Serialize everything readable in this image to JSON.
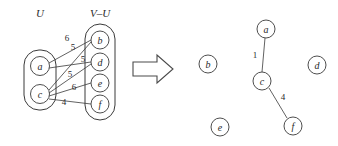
{
  "figure": {
    "colors": {
      "ink": "#3a3a3a",
      "text": "#2a2a2a",
      "background": "#ffffff"
    },
    "left_panel": {
      "set_label_u": "U",
      "set_label_v_minus_u": "V–U",
      "u_nodes": [
        {
          "id": "a",
          "label": "a",
          "cx": 40,
          "cy": 66,
          "r": 9.5
        },
        {
          "id": "c",
          "label": "c",
          "cx": 40,
          "cy": 94,
          "r": 9.5
        }
      ],
      "v_nodes": [
        {
          "id": "b",
          "label": "b",
          "cx": 100,
          "cy": 40,
          "r": 9
        },
        {
          "id": "d",
          "label": "d",
          "cx": 100,
          "cy": 62,
          "r": 9
        },
        {
          "id": "e",
          "label": "e",
          "cx": 100,
          "cy": 83,
          "r": 9
        },
        {
          "id": "f",
          "label": "f",
          "cx": 100,
          "cy": 104,
          "r": 9
        }
      ],
      "edges": [
        {
          "from": "a",
          "to": "b",
          "weight": "6",
          "lx": 67,
          "ly": 41
        },
        {
          "from": "a",
          "to": "d",
          "weight": "5",
          "lx": 73,
          "ly": 50
        },
        {
          "from": "c",
          "to": "b",
          "weight": "5",
          "lx": 83,
          "ly": 62
        },
        {
          "from": "c",
          "to": "d",
          "weight": "5",
          "lx": 70,
          "ly": 77
        },
        {
          "from": "c",
          "to": "e",
          "weight": "6",
          "lx": 74,
          "ly": 90
        },
        {
          "from": "c",
          "to": "f",
          "weight": "4",
          "lx": 64,
          "ly": 105
        }
      ]
    },
    "arrow": {
      "name": "right-arrow",
      "points": "133,62 157,62 157,55 173,69 157,83 157,76 133,76"
    },
    "right_panel": {
      "nodes": [
        {
          "id": "a",
          "label": "a",
          "cx": 266,
          "cy": 29,
          "r": 9
        },
        {
          "id": "b",
          "label": "b",
          "cx": 208,
          "cy": 64,
          "r": 9
        },
        {
          "id": "c",
          "label": "c",
          "cx": 262,
          "cy": 81,
          "r": 9
        },
        {
          "id": "d",
          "label": "d",
          "cx": 317,
          "cy": 65,
          "r": 9
        },
        {
          "id": "e",
          "label": "e",
          "cx": 220,
          "cy": 127,
          "r": 9
        },
        {
          "id": "f",
          "label": "f",
          "cx": 293,
          "cy": 126,
          "r": 9
        }
      ],
      "edges": [
        {
          "from": "a",
          "to": "c",
          "weight": "1",
          "lx": 255,
          "ly": 58
        },
        {
          "from": "c",
          "to": "f",
          "weight": "4",
          "lx": 283,
          "ly": 100
        }
      ]
    }
  }
}
